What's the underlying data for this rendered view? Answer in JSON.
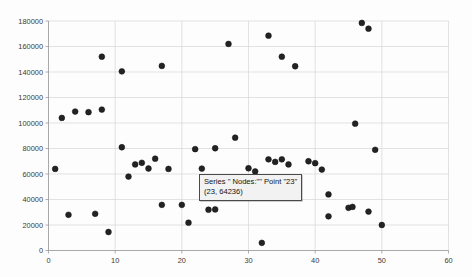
{
  "chart_data": {
    "type": "scatter",
    "title": "",
    "xlabel": "",
    "ylabel": "",
    "xlim": [
      0,
      60
    ],
    "ylim": [
      0,
      180000
    ],
    "grid": true,
    "legend_position": "none",
    "x_ticks": [
      0,
      10,
      20,
      30,
      40,
      50,
      60
    ],
    "x_tick_labels": [
      "0",
      "10",
      "20",
      "30",
      "40",
      "50",
      "60"
    ],
    "y_ticks": [
      0,
      20000,
      40000,
      60000,
      80000,
      100000,
      120000,
      140000,
      160000,
      180000
    ],
    "y_tick_labels": [
      "0",
      "20000",
      "40000",
      "60000",
      "80000",
      "100000",
      "120000",
      "140000",
      "160000",
      "180000"
    ],
    "series": [
      {
        "name": "Nodes:",
        "color": "#232323",
        "marker": "circle",
        "points": [
          [
            1,
            64000
          ],
          [
            2,
            104000
          ],
          [
            3,
            28000
          ],
          [
            4,
            109000
          ],
          [
            6,
            108500
          ],
          [
            7,
            28800
          ],
          [
            8,
            152000
          ],
          [
            8,
            110500
          ],
          [
            9,
            14500
          ],
          [
            11,
            140500
          ],
          [
            11,
            81000
          ],
          [
            12,
            58000
          ],
          [
            13,
            67500
          ],
          [
            14,
            68800
          ],
          [
            15,
            64300
          ],
          [
            16,
            72000
          ],
          [
            17,
            35800
          ],
          [
            17,
            144800
          ],
          [
            18,
            64000
          ],
          [
            20,
            35800
          ],
          [
            21,
            21800
          ],
          [
            22,
            79500
          ],
          [
            23,
            64236
          ],
          [
            24,
            32000
          ],
          [
            25,
            32200
          ],
          [
            25,
            80200
          ],
          [
            27,
            162000
          ],
          [
            28,
            88500
          ],
          [
            30,
            64500
          ],
          [
            31,
            62000
          ],
          [
            32,
            6000
          ],
          [
            33,
            71500
          ],
          [
            33,
            168500
          ],
          [
            34,
            69500
          ],
          [
            35,
            71500
          ],
          [
            35,
            152000
          ],
          [
            36,
            67500
          ],
          [
            37,
            144500
          ],
          [
            39,
            70000
          ],
          [
            40,
            68500
          ],
          [
            41,
            63500
          ],
          [
            42,
            44000
          ],
          [
            42,
            26800
          ],
          [
            45,
            33500
          ],
          [
            45.6,
            34200
          ],
          [
            46,
            99500
          ],
          [
            47,
            178500
          ],
          [
            48,
            30500
          ],
          [
            48,
            174000
          ],
          [
            49,
            79000
          ],
          [
            50,
            20000
          ]
        ]
      }
    ],
    "tooltip": {
      "visible": true,
      "line1": "Series \" Nodes:\"\" Point \"23\"",
      "line2": "(23, 64236)",
      "point": [
        23,
        64236
      ]
    }
  }
}
